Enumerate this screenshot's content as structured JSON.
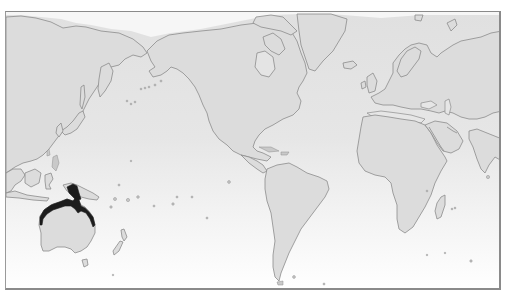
{
  "map": {
    "projection": "pacific-centered-world",
    "subject": "species-distribution-range",
    "highlighted_region": "Northern Australia and southern New Guinea",
    "colors": {
      "ocean_top": "#e2e2e2",
      "ocean_bottom": "#ffffff",
      "land": "#dcdcdc",
      "outline": "#8c8c8c",
      "range": "#1c1c1c",
      "frame": "#8a8a8a"
    },
    "frame": {
      "x": 5,
      "y": 11,
      "width": 496,
      "height": 279
    },
    "regions": [
      {
        "name": "Asia-Pacific coast"
      },
      {
        "name": "Australia"
      },
      {
        "name": "New Guinea"
      },
      {
        "name": "New Zealand"
      },
      {
        "name": "North America"
      },
      {
        "name": "Greenland"
      },
      {
        "name": "South America"
      },
      {
        "name": "Europe"
      },
      {
        "name": "Africa"
      },
      {
        "name": "Madagascar"
      },
      {
        "name": "Middle East & India"
      }
    ]
  }
}
